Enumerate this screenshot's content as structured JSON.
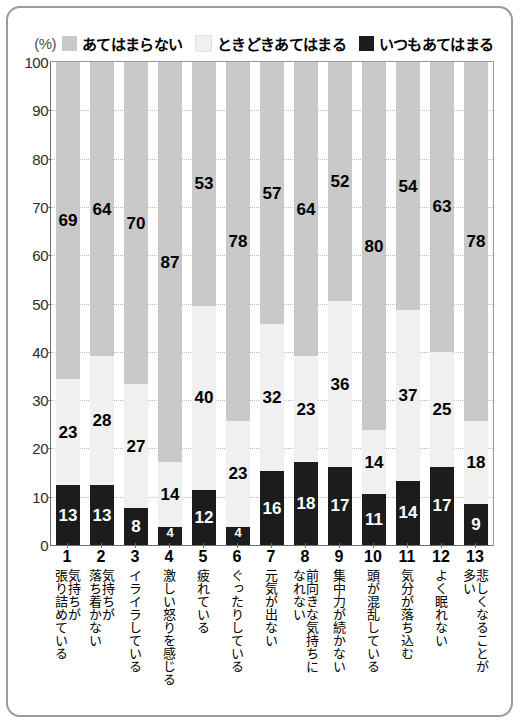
{
  "axis": {
    "unit_label": "(%)",
    "y_ticks": [
      0,
      10,
      20,
      30,
      40,
      50,
      60,
      70,
      80,
      90,
      100
    ],
    "y_min": 0,
    "y_max": 100
  },
  "legend": {
    "items": [
      {
        "label": "あてはまらない",
        "color": "#c9c9c9",
        "icon": "square-swatch-icon"
      },
      {
        "label": "ときどきあてはまる",
        "color": "#f0f0f0",
        "icon": "square-swatch-icon"
      },
      {
        "label": "いつもあてはまる",
        "color": "#1c1c1c",
        "icon": "square-swatch-icon"
      }
    ]
  },
  "chart_data": {
    "type": "bar",
    "subtype": "stacked-bar-100",
    "title": "",
    "xlabel": "",
    "ylabel": "(%)",
    "ylim": [
      0,
      100
    ],
    "grid": true,
    "legend_position": "top",
    "categories": [
      "気持ちが張り詰めている",
      "気持ちが落ち着かない",
      "イライラしている",
      "激しい怒りを感じる",
      "疲れている",
      "ぐったりしている",
      "元気が出ない",
      "前向きな気持ちになれない",
      "集中力が続かない",
      "頭が混乱している",
      "気分が落ち込む",
      "よく眠れない",
      "悲しくなることが多い"
    ],
    "category_numbers": [
      "1",
      "2",
      "3",
      "4",
      "5",
      "6",
      "7",
      "8",
      "9",
      "10",
      "11",
      "12",
      "13"
    ],
    "category_lines": [
      [
        "気持ちが",
        "張り詰めている"
      ],
      [
        "気持ちが",
        "落ち着かない"
      ],
      [
        "イライラしている"
      ],
      [
        "激しい怒りを感じる"
      ],
      [
        "疲れている"
      ],
      [
        "ぐったりしている"
      ],
      [
        "元気が出ない"
      ],
      [
        "前向きな気持ちに",
        "なれない"
      ],
      [
        "集中力が続かない"
      ],
      [
        "頭が混乱している"
      ],
      [
        "気分が落ち込む"
      ],
      [
        "よく眠れない"
      ],
      [
        "悲しくなることが",
        "多い"
      ]
    ],
    "series": [
      {
        "name": "いつもあてはまる",
        "color": "#1c1c1c",
        "values": [
          13,
          13,
          8,
          4,
          12,
          4,
          16,
          18,
          17,
          11,
          14,
          17,
          9
        ]
      },
      {
        "name": "ときどきあてはまる",
        "color": "#f0f0f0",
        "values": [
          23,
          28,
          27,
          14,
          40,
          23,
          32,
          23,
          36,
          14,
          37,
          25,
          18
        ]
      },
      {
        "name": "あてはまらない",
        "color": "#c9c9c9",
        "values": [
          69,
          64,
          70,
          87,
          53,
          78,
          57,
          64,
          52,
          80,
          54,
          63,
          78
        ]
      }
    ]
  }
}
